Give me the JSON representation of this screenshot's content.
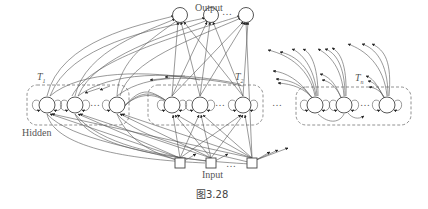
{
  "figure": {
    "caption": "图3.28",
    "labels": {
      "output": "Output",
      "input": "Input",
      "hidden": "Hidden",
      "t1": "T",
      "t1_sub": "1",
      "t2": "T",
      "t2_sub": "2",
      "tn": "T",
      "tn_sub": "n",
      "ellipsis": "…"
    },
    "colors": {
      "stroke": "#555555",
      "dashed": "#777777",
      "text": "#555555",
      "background": "#ffffff"
    }
  },
  "layers": {
    "output": {
      "nodes": 3,
      "shape": "circle",
      "has_ellipsis": true
    },
    "hidden_blocks": [
      {
        "name": "T1",
        "nodes": 3,
        "has_ellipsis": true
      },
      {
        "name": "T2",
        "nodes": 3,
        "has_ellipsis": true
      },
      {
        "name": "Tn",
        "nodes": 3,
        "has_ellipsis": true
      }
    ],
    "input": {
      "nodes": 3,
      "shape": "square",
      "has_ellipsis": true
    }
  }
}
